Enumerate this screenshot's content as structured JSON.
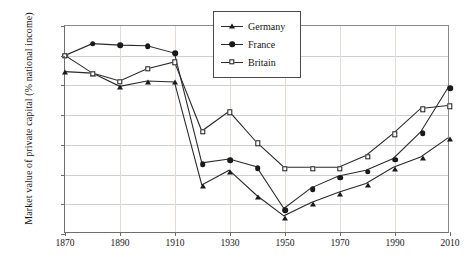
{
  "chart_data": {
    "type": "line",
    "title": "",
    "xlabel": "",
    "ylabel": "Market value of private capital (% national income)",
    "xlim": [
      1870,
      2010
    ],
    "ylim": [
      100,
      800
    ],
    "grid": true,
    "legend_position": "top-center",
    "x_ticks": [
      "1870",
      "1890",
      "1910",
      "1930",
      "1950",
      "1970",
      "1990",
      "2010"
    ],
    "x_tick_values": [
      1870,
      1890,
      1910,
      1930,
      1950,
      1970,
      1990,
      2010
    ],
    "y_ticks": [
      "100%",
      "200%",
      "300%",
      "400%",
      "500%",
      "600%",
      "700%",
      "800%"
    ],
    "y_tick_values": [
      100,
      200,
      300,
      400,
      500,
      600,
      700,
      800
    ],
    "x": [
      1870,
      1880,
      1890,
      1900,
      1910,
      1920,
      1930,
      1940,
      1950,
      1960,
      1970,
      1980,
      1990,
      2000,
      2010
    ],
    "series": [
      {
        "name": "Germany",
        "marker": "triangle",
        "values": [
          645,
          640,
          595,
          613,
          610,
          260,
          310,
          225,
          155,
          200,
          235,
          265,
          320,
          355,
          420
        ]
      },
      {
        "name": "France",
        "marker": "circle",
        "values": [
          700,
          740,
          735,
          733,
          708,
          335,
          348,
          322,
          180,
          250,
          290,
          310,
          350,
          440,
          590
        ]
      },
      {
        "name": "Britain",
        "marker": "square",
        "values": [
          700,
          640,
          613,
          655,
          678,
          443,
          510,
          405,
          320,
          320,
          320,
          360,
          435,
          520,
          530
        ]
      }
    ]
  },
  "legend": {
    "items": [
      {
        "label": "Germany",
        "marker": "triangle"
      },
      {
        "label": "France",
        "marker": "circle"
      },
      {
        "label": "Britain",
        "marker": "square"
      }
    ]
  }
}
